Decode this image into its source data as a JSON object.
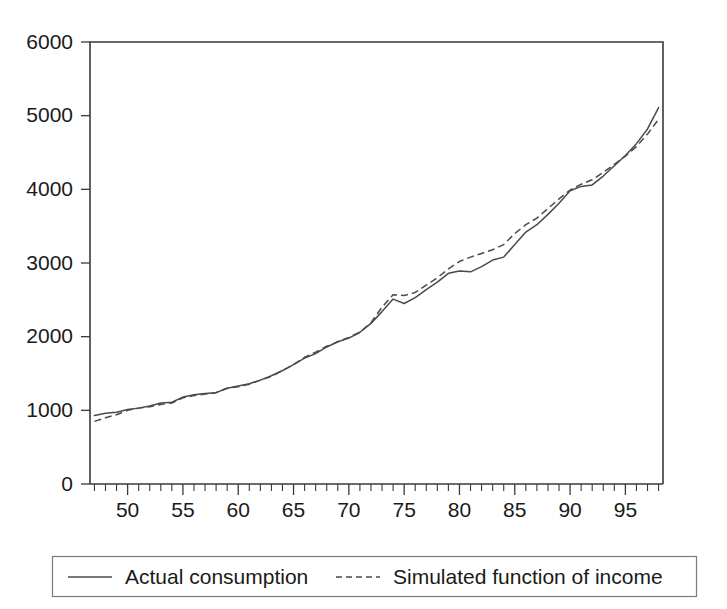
{
  "chart_data": {
    "type": "line",
    "title": "",
    "subtitle": "",
    "xlabel": "",
    "ylabel": "",
    "xlim": [
      46.6,
      98.4
    ],
    "ylim": [
      0,
      6000
    ],
    "grid": false,
    "legend_position": "bottom",
    "y_ticks": [
      0,
      1000,
      2000,
      3000,
      4000,
      5000,
      6000
    ],
    "y_tick_labels": [
      "0",
      "1000",
      "2000",
      "3000",
      "4000",
      "5000",
      "6000"
    ],
    "x_ticks_major": [
      50,
      55,
      60,
      65,
      70,
      75,
      80,
      85,
      90,
      95
    ],
    "x_tick_labels": [
      "50",
      "55",
      "60",
      "65",
      "70",
      "75",
      "80",
      "85",
      "90",
      "95"
    ],
    "x_minor_tick_step": 1,
    "x": [
      47,
      48,
      49,
      50,
      51,
      52,
      53,
      54,
      55,
      56,
      57,
      58,
      59,
      60,
      61,
      62,
      63,
      64,
      65,
      66,
      67,
      68,
      69,
      70,
      71,
      72,
      73,
      74,
      75,
      76,
      77,
      78,
      79,
      80,
      81,
      82,
      83,
      84,
      85,
      86,
      87,
      88,
      89,
      90,
      91,
      92,
      93,
      94,
      95,
      96,
      97,
      98
    ],
    "series": [
      {
        "name": "Actual consumption",
        "style": "solid",
        "color": "#4a4a4a",
        "values": [
          930,
          960,
          975,
          1010,
          1030,
          1060,
          1100,
          1110,
          1180,
          1210,
          1230,
          1240,
          1300,
          1330,
          1360,
          1410,
          1470,
          1540,
          1620,
          1710,
          1770,
          1860,
          1930,
          1980,
          2060,
          2180,
          2340,
          2510,
          2450,
          2530,
          2640,
          2740,
          2860,
          2890,
          2880,
          2950,
          3040,
          3080,
          3250,
          3420,
          3520,
          3660,
          3810,
          3980,
          4040,
          4060,
          4180,
          4320,
          4460,
          4620,
          4820,
          5110
        ]
      },
      {
        "name": "Simulated function of income",
        "style": "dashed",
        "color": "#4a4a4a",
        "values": [
          850,
          900,
          940,
          1000,
          1030,
          1050,
          1080,
          1100,
          1170,
          1200,
          1220,
          1240,
          1300,
          1320,
          1355,
          1410,
          1460,
          1540,
          1620,
          1720,
          1790,
          1870,
          1930,
          1990,
          2060,
          2190,
          2400,
          2570,
          2560,
          2600,
          2700,
          2800,
          2920,
          3020,
          3080,
          3130,
          3180,
          3250,
          3400,
          3520,
          3610,
          3740,
          3870,
          3990,
          4070,
          4130,
          4230,
          4340,
          4450,
          4580,
          4750,
          4950
        ]
      }
    ]
  },
  "legend": {
    "items": [
      {
        "label": "Actual consumption",
        "style": "solid"
      },
      {
        "label": "Simulated function of income",
        "style": "dashed"
      }
    ]
  }
}
